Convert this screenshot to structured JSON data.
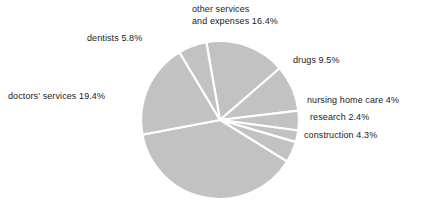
{
  "chart_data": {
    "type": "pie",
    "title": "",
    "subtitle": "",
    "xlabel": "",
    "ylabel": "",
    "legend_position": "callout-labels",
    "grid": false,
    "units": "percent",
    "slice_fill_color": "#c2c2c2",
    "separator_color": "#ffffff",
    "background_color": "#ffffff",
    "label_color": "#1b1b1b",
    "categories": [
      "other services and expenses",
      "drugs",
      "nursing home care",
      "research",
      "construction",
      "unlabeled remainder",
      "doctors' services",
      "dentists"
    ],
    "values": [
      16.4,
      9.5,
      4.0,
      2.4,
      4.3,
      38.2,
      19.4,
      5.8
    ],
    "labels": [
      {
        "name": "other-services",
        "text_line1": "other services",
        "text_line2": "and expenses 16.4%",
        "value": 16.4,
        "value_text": "16.4%"
      },
      {
        "name": "dentists",
        "text": "dentists 5.8%",
        "value": 5.8,
        "value_text": "5.8%"
      },
      {
        "name": "doctors-services",
        "text": "doctors' services 19.4%",
        "value": 19.4,
        "value_text": "19.4%"
      },
      {
        "name": "drugs",
        "text": "drugs 9.5%",
        "value": 9.5,
        "value_text": "9.5%"
      },
      {
        "name": "nursing-home-care",
        "text": "nursing home care 4%",
        "value": 4.0,
        "value_text": "4%"
      },
      {
        "name": "research",
        "text": "research 2.4%",
        "value": 2.4,
        "value_text": "2.4%"
      },
      {
        "name": "construction",
        "text": "construction 4.3%",
        "value": 4.3,
        "value_text": "4.3%"
      }
    ]
  },
  "geometry": {
    "center_x": 220,
    "center_y": 120,
    "radius": 79
  }
}
